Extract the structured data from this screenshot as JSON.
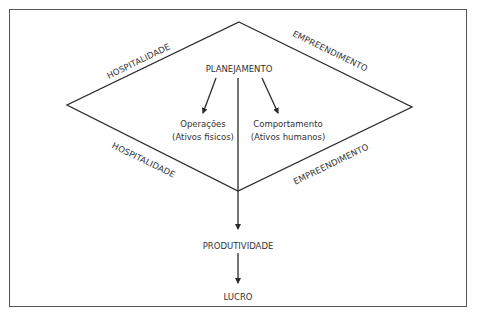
{
  "diagram": {
    "colors": {
      "line": "#2b2b2b",
      "text": "#333333",
      "border": "#555555",
      "background": "#ffffff"
    },
    "diamond_edges": {
      "top_left": "HOSPITALIDADE",
      "top_right": "EMPREENDIMENTO",
      "bottom_left": "HOSPITALIDADE",
      "bottom_right": "EMPREENDIMENTO"
    },
    "nodes": {
      "top": "PLANEJAMENTO",
      "left": {
        "line1": "Operações",
        "line2": "(Ativos fisicos)"
      },
      "right": {
        "line1": "Comportamento",
        "line2": "(Ativos humanos)"
      },
      "middle": "PRODUTIVIDADE",
      "bottom": "LUCRO"
    },
    "edges": [
      {
        "from": "PLANEJAMENTO",
        "to": "Operações (Ativos fisicos)"
      },
      {
        "from": "PLANEJAMENTO",
        "to": "Comportamento (Ativos humanos)"
      },
      {
        "from": "PLANEJAMENTO",
        "to": "PRODUTIVIDADE"
      },
      {
        "from": "PRODUTIVIDADE",
        "to": "LUCRO"
      }
    ]
  }
}
